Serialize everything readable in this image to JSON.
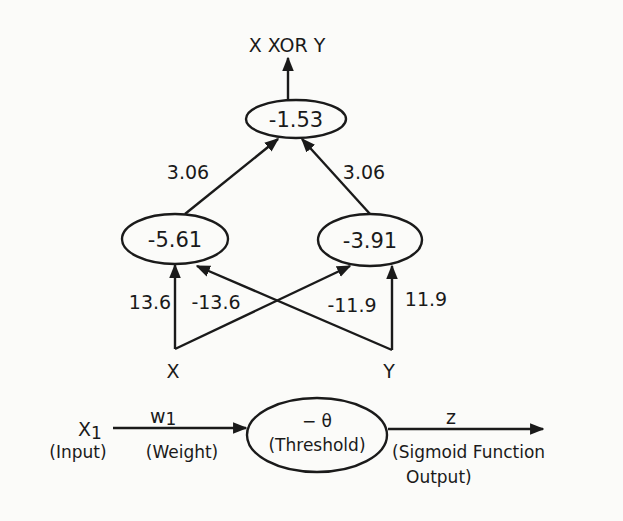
{
  "colors": {
    "ink": "#1a1a1a",
    "paper": "#fbfbf9"
  },
  "network": {
    "output_label": "X XOR Y",
    "output_node": {
      "threshold": "-1.53"
    },
    "hidden_nodes": [
      {
        "id": "h1",
        "threshold": "-5.61"
      },
      {
        "id": "h2",
        "threshold": "-3.91"
      }
    ],
    "hidden_to_output_weights": [
      {
        "from": "h1",
        "to": "out",
        "weight": "3.06"
      },
      {
        "from": "h2",
        "to": "out",
        "weight": "3.06"
      }
    ],
    "inputs": [
      {
        "id": "x",
        "label": "X"
      },
      {
        "id": "y",
        "label": "Y"
      }
    ],
    "input_to_hidden_weights": [
      {
        "from": "x",
        "to": "h1",
        "weight": "13.6"
      },
      {
        "from": "x",
        "to": "h2",
        "weight": "-13.6"
      },
      {
        "from": "y",
        "to": "h1",
        "weight": "-11.9"
      },
      {
        "from": "y",
        "to": "h2",
        "weight": "11.9"
      }
    ]
  },
  "legend": {
    "input_symbol": "X",
    "input_subscript": "1",
    "input_desc": "(Input)",
    "weight_symbol": "w",
    "weight_subscript": "1",
    "weight_desc": "(Weight)",
    "threshold_symbol": "− θ",
    "threshold_desc": "(Threshold)",
    "output_symbol": "z",
    "output_desc_line1": "(Sigmoid Function",
    "output_desc_line2": "Output)"
  }
}
